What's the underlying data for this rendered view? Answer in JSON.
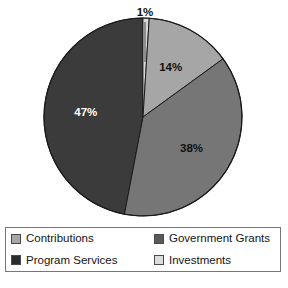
{
  "chart_data": {
    "type": "pie",
    "title": "",
    "subtitle": "",
    "xlabel": "",
    "ylabel": "",
    "legend_position": "bottom",
    "grid": false,
    "start_angle_deg": 0,
    "direction": "clockwise",
    "categories": [
      "Investments",
      "Contributions",
      "Government Grants",
      "Program Services"
    ],
    "values": [
      1,
      14,
      38,
      47
    ],
    "labels": [
      "1%",
      "14%",
      "38%",
      "47%"
    ],
    "colors": [
      "#d8d8d8",
      "#a6a6a6",
      "#767676",
      "#3b3b3b"
    ],
    "slices": [
      {
        "name": "Investments",
        "value": 1,
        "label": "1%",
        "color": "#d8d8d8",
        "label_color": "#111111",
        "label_placement": "outside-callout"
      },
      {
        "name": "Contributions",
        "value": 14,
        "label": "14%",
        "color": "#a6a6a6",
        "label_color": "#111111",
        "label_placement": "inside"
      },
      {
        "name": "Government Grants",
        "value": 38,
        "label": "38%",
        "color": "#767676",
        "label_color": "#111111",
        "label_placement": "inside"
      },
      {
        "name": "Program Services",
        "value": 47,
        "label": "47%",
        "color": "#3b3b3b",
        "label_color": "#ffffff",
        "label_placement": "inside"
      }
    ]
  },
  "pie": {
    "slice_1_label": "1%",
    "slice_14_label": "14%",
    "slice_38_label": "38%",
    "slice_47_label": "47%"
  },
  "legend": {
    "entries": [
      {
        "label": "Contributions",
        "color": "#a6a6a6"
      },
      {
        "label": "Government Grants",
        "color": "#5a5a5a"
      },
      {
        "label": "Program Services",
        "color": "#2b2b2b"
      },
      {
        "label": "Investments",
        "color": "#dcdcdc"
      }
    ]
  }
}
